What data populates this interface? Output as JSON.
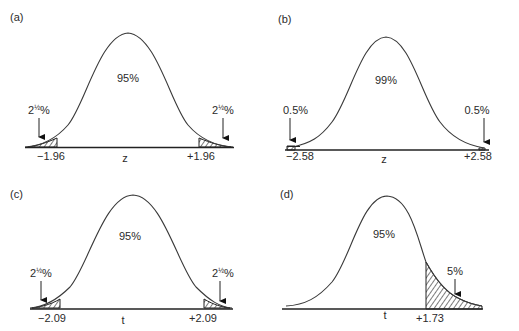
{
  "panels": [
    {
      "id": "a",
      "label": "(a)",
      "distribution": "z",
      "axis_label": "z",
      "center_text": "95%",
      "tails": "two",
      "left_crit": "−1.96",
      "right_crit": "+1.96",
      "left_tail_pct_main": "2",
      "left_tail_pct_sup": "½",
      "left_tail_pct_end": "%",
      "right_tail_pct_main": "2",
      "right_tail_pct_sup": "½",
      "right_tail_pct_end": "%"
    },
    {
      "id": "b",
      "label": "(b)",
      "distribution": "z",
      "axis_label": "z",
      "center_text": "99%",
      "tails": "two",
      "left_crit": "−2.58",
      "right_crit": "+2.58",
      "left_tail_pct": "0.5%",
      "right_tail_pct": "0.5%"
    },
    {
      "id": "c",
      "label": "(c)",
      "distribution": "t",
      "axis_label": "t",
      "center_text": "95%",
      "tails": "two",
      "left_crit": "−2.09",
      "right_crit": "+2.09",
      "left_tail_pct_main": "2",
      "left_tail_pct_sup": "½",
      "left_tail_pct_end": "%",
      "right_tail_pct_main": "2",
      "right_tail_pct_sup": "½",
      "right_tail_pct_end": "%"
    },
    {
      "id": "d",
      "label": "(d)",
      "distribution": "t",
      "axis_label": "t",
      "center_text": "95%",
      "tails": "one (right)",
      "right_crit": "+1.73",
      "right_tail_pct": "5%"
    }
  ],
  "colors": {
    "line": "#3a3a3a",
    "axis": "#222222",
    "background": "#ffffff"
  }
}
